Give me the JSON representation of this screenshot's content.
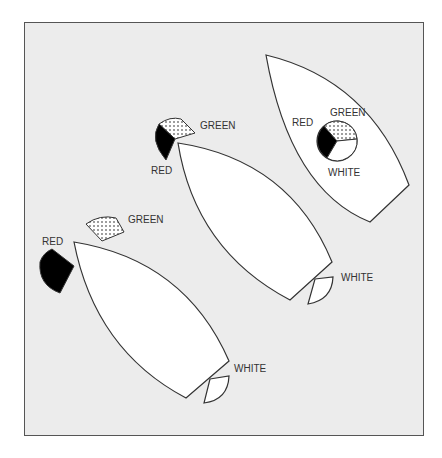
{
  "diagram": {
    "type": "navigation-lights",
    "colors": {
      "background": "#ececec",
      "frame": "#555555",
      "hull": "#ffffff",
      "outline": "#333333",
      "red_light": "#000000",
      "green_light_pattern": "dotted",
      "white_light": "#ffffff"
    },
    "vessels": [
      {
        "id": "lower-left",
        "lights": {
          "red": "RED",
          "green": "GREEN",
          "white": "WHITE"
        },
        "arrangement": "separate sidelights at bow, sternlight at stern"
      },
      {
        "id": "middle",
        "lights": {
          "red": "RED",
          "green": "GREEN",
          "white": "WHITE"
        },
        "arrangement": "combined bicolour lantern at bow, sternlight at stern"
      },
      {
        "id": "upper-right",
        "lights": {
          "red": "RED",
          "green": "GREEN",
          "white": "WHITE"
        },
        "arrangement": "tricolour masthead lantern"
      }
    ]
  }
}
